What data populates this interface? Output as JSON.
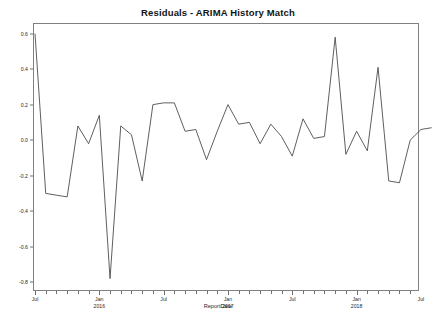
{
  "chart_data": {
    "type": "line",
    "title": "Residuals - ARIMA History Match",
    "xlabel": "ReportDate",
    "ylabel": "",
    "grid": false,
    "legend": false,
    "ylim": [
      -0.85,
      0.66
    ],
    "xlim": [
      "2015-07",
      "2018-08"
    ],
    "ytick_values": [
      0.6,
      0.4,
      0.2,
      0.0,
      -0.2,
      -0.4,
      -0.6,
      -0.8
    ],
    "ytick_labels": [
      "0.6",
      "0.4",
      "0.2",
      "0.0",
      "-0.2",
      "-0.4",
      "-0.6",
      "-0.8"
    ],
    "xtick_labels": [
      {
        "line1": "Jul",
        "line2": ""
      },
      {
        "line1": "Jan",
        "line2": "2016"
      },
      {
        "line1": "Jul",
        "line2": ""
      },
      {
        "line1": "Jan",
        "line2": "2017"
      },
      {
        "line1": "Jul",
        "line2": ""
      },
      {
        "line1": "Jan",
        "line2": "2018"
      },
      {
        "line1": "Jul",
        "line2": ""
      }
    ],
    "xtick_major_months": [
      0,
      6,
      12,
      18,
      24,
      30,
      36
    ],
    "x_minor_tick_interval_months": 1,
    "series": [
      {
        "name": "Residuals",
        "color": "#4d4d4d",
        "x": [
          "2015-07",
          "2015-08",
          "2015-09",
          "2015-10",
          "2015-11",
          "2015-12",
          "2016-01",
          "2016-02",
          "2016-03",
          "2016-04",
          "2016-05",
          "2016-06",
          "2016-07",
          "2016-08",
          "2016-09",
          "2016-10",
          "2016-11",
          "2016-12",
          "2017-01",
          "2017-02",
          "2017-03",
          "2017-04",
          "2017-05",
          "2017-06",
          "2017-07",
          "2017-08",
          "2017-09",
          "2017-10",
          "2017-11",
          "2017-12",
          "2018-01",
          "2018-02",
          "2018-03",
          "2018-04",
          "2018-05",
          "2018-06",
          "2018-07",
          "2018-08"
        ],
        "values": [
          0.6,
          -0.3,
          -0.31,
          -0.32,
          0.08,
          -0.02,
          0.14,
          -0.78,
          0.08,
          0.03,
          -0.23,
          0.2,
          0.21,
          0.21,
          0.05,
          0.06,
          -0.11,
          0.05,
          0.2,
          0.09,
          0.1,
          -0.02,
          0.09,
          0.02,
          -0.09,
          0.12,
          0.01,
          0.02,
          0.58,
          -0.08,
          0.05,
          -0.06,
          0.41,
          -0.23,
          -0.24,
          0.0,
          0.06,
          0.07
        ]
      }
    ]
  }
}
